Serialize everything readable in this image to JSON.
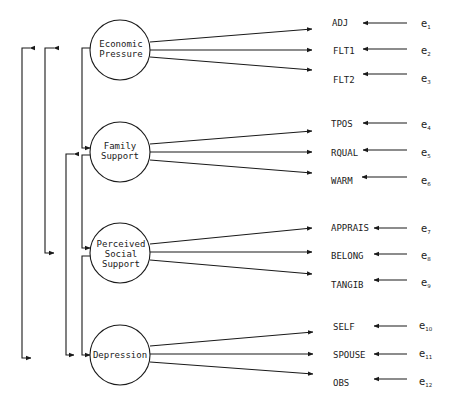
{
  "diagram": {
    "type": "structural-equation-model",
    "colors": {
      "ink": "#1a1a1a",
      "background": "#ffffff"
    },
    "factors": [
      {
        "id": "economic-pressure",
        "lines": [
          "Economic",
          "Pressure"
        ]
      },
      {
        "id": "family-support",
        "lines": [
          "Family",
          "Support"
        ]
      },
      {
        "id": "perceived-social-support",
        "lines": [
          "Perceived",
          "Social",
          "Support"
        ]
      },
      {
        "id": "depression",
        "lines": [
          "Depression"
        ]
      }
    ],
    "indicators": [
      {
        "label": "ADJ",
        "error": "e",
        "sub": "1",
        "factor": "economic-pressure"
      },
      {
        "label": "FLT1",
        "error": "e",
        "sub": "2",
        "factor": "economic-pressure"
      },
      {
        "label": "FLT2",
        "error": "e",
        "sub": "3",
        "factor": "economic-pressure"
      },
      {
        "label": "TPOS",
        "error": "e",
        "sub": "4",
        "factor": "family-support"
      },
      {
        "label": "RQUAL",
        "error": "e",
        "sub": "5",
        "factor": "family-support"
      },
      {
        "label": "WARM",
        "error": "e",
        "sub": "6",
        "factor": "family-support"
      },
      {
        "label": "APPRAIS",
        "error": "e",
        "sub": "7",
        "factor": "perceived-social-support"
      },
      {
        "label": "BELONG",
        "error": "e",
        "sub": "8",
        "factor": "perceived-social-support"
      },
      {
        "label": "TANGIB",
        "error": "e",
        "sub": "9",
        "factor": "perceived-social-support"
      },
      {
        "label": "SELF",
        "error": "e",
        "sub": "10",
        "factor": "depression"
      },
      {
        "label": "SPOUSE",
        "error": "e",
        "sub": "11",
        "factor": "depression"
      },
      {
        "label": "OBS",
        "error": "e",
        "sub": "12",
        "factor": "depression"
      }
    ],
    "covariances": [
      [
        "economic-pressure",
        "depression"
      ],
      [
        "economic-pressure",
        "perceived-social-support"
      ],
      [
        "economic-pressure",
        "family-support"
      ],
      [
        "family-support",
        "perceived-social-support"
      ],
      [
        "family-support",
        "depression"
      ],
      [
        "perceived-social-support",
        "depression"
      ]
    ]
  }
}
